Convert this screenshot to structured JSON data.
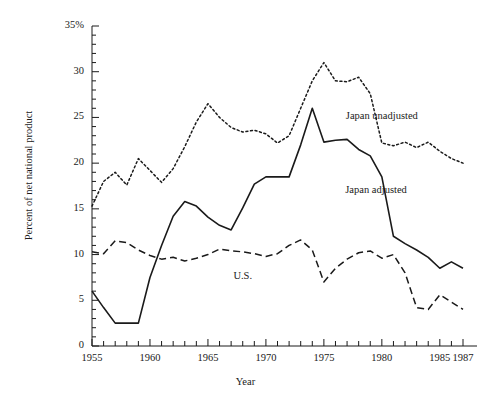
{
  "chart_data": {
    "type": "line",
    "title": "",
    "xlabel": "Year",
    "ylabel": "Percent of net national product",
    "xlim": [
      1955,
      1987
    ],
    "ylim": [
      0,
      35
    ],
    "xticks": [
      1955,
      1956,
      1957,
      1958,
      1959,
      1960,
      1961,
      1962,
      1963,
      1964,
      1965,
      1966,
      1967,
      1968,
      1969,
      1970,
      1971,
      1972,
      1973,
      1974,
      1975,
      1976,
      1977,
      1978,
      1979,
      1980,
      1981,
      1982,
      1983,
      1984,
      1985,
      1986,
      1987
    ],
    "xtick_labels": [
      {
        "value": 1955,
        "label": "1955"
      },
      {
        "value": 1960,
        "label": "1960"
      },
      {
        "value": 1965,
        "label": "1965"
      },
      {
        "value": 1970,
        "label": "1970"
      },
      {
        "value": 1975,
        "label": "1975"
      },
      {
        "value": 1980,
        "label": "1980"
      },
      {
        "value": 1985,
        "label": "1985"
      },
      {
        "value": 1987,
        "label": "1987"
      }
    ],
    "yticks": [
      0,
      5,
      10,
      15,
      20,
      25,
      30,
      35
    ],
    "ytick_minor_step": 1,
    "ytick_labels": [
      {
        "value": 0,
        "label": "0"
      },
      {
        "value": 5,
        "label": "5"
      },
      {
        "value": 10,
        "label": "10"
      },
      {
        "value": 15,
        "label": "15"
      },
      {
        "value": 20,
        "label": "20"
      },
      {
        "value": 25,
        "label": "25"
      },
      {
        "value": 30,
        "label": "30"
      },
      {
        "value": 35,
        "label": "35%"
      }
    ],
    "grid": false,
    "legend_position": "inline-annotations",
    "x": [
      1955,
      1956,
      1957,
      1958,
      1959,
      1960,
      1961,
      1962,
      1963,
      1964,
      1965,
      1966,
      1967,
      1968,
      1969,
      1970,
      1971,
      1972,
      1973,
      1974,
      1975,
      1976,
      1977,
      1978,
      1979,
      1980,
      1981,
      1982,
      1983,
      1984,
      1985,
      1986,
      1987
    ],
    "series": [
      {
        "name": "Japan unadjusted",
        "style": "dotted",
        "color": "#1a1a1a",
        "label_x": 1980.0,
        "label_y": 25.0,
        "values": [
          15.3,
          18.0,
          19.0,
          17.6,
          20.5,
          19.2,
          17.9,
          19.4,
          21.8,
          24.5,
          26.5,
          25.0,
          23.9,
          23.4,
          23.6,
          23.2,
          22.2,
          23.0,
          26.0,
          29.0,
          31.0,
          29.0,
          28.9,
          29.4,
          27.6,
          22.2,
          21.9,
          22.3,
          21.7,
          22.3,
          21.3,
          20.5,
          20.0
        ]
      },
      {
        "name": "Japan adjusted",
        "style": "solid",
        "color": "#1a1a1a",
        "label_x": 1979.5,
        "label_y": 17.0,
        "values": [
          6.0,
          4.2,
          2.5,
          2.5,
          2.5,
          7.5,
          11.0,
          14.2,
          15.8,
          15.3,
          14.1,
          13.2,
          12.7,
          15.1,
          17.7,
          18.5,
          18.5,
          18.5,
          22.0,
          26.0,
          22.3,
          22.5,
          22.6,
          21.5,
          20.8,
          18.5,
          12.0,
          11.2,
          10.5,
          9.7,
          8.5,
          9.2,
          8.5
        ]
      },
      {
        "name": "U.S.",
        "style": "dashed",
        "color": "#1a1a1a",
        "label_x": 1968.0,
        "label_y": 7.5,
        "values": [
          10.3,
          10.1,
          11.5,
          11.3,
          10.5,
          9.9,
          9.5,
          9.7,
          9.3,
          9.6,
          10.0,
          10.6,
          10.4,
          10.3,
          10.1,
          9.8,
          10.1,
          11.0,
          11.6,
          10.5,
          7.0,
          8.5,
          9.5,
          10.2,
          10.4,
          9.6,
          10.0,
          8.0,
          4.2,
          4.0,
          5.6,
          4.8,
          4.0
        ]
      }
    ]
  },
  "series_order_render": [
    "japan_unadjusted",
    "japan_adjusted",
    "us"
  ],
  "annotations": {
    "japan_unadjusted_label": "Japan unadjusted",
    "japan_adjusted_label": "Japan adjusted",
    "us_label": "U.S."
  },
  "axes": {
    "x_title": "Year",
    "y_title": "Percent of net national product"
  }
}
